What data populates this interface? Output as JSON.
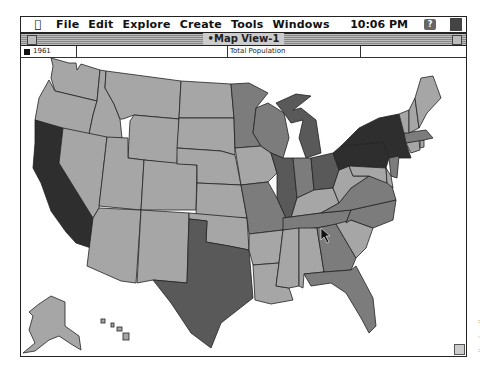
{
  "menubar": {
    "apple_icon": "",
    "items": [
      "File",
      "Edit",
      "Explore",
      "Create",
      "Tools",
      "Windows"
    ],
    "clock": "10:06 PM",
    "help_icon": "?"
  },
  "window": {
    "title": "•Map View-1",
    "info": {
      "year": "1961",
      "variable": "Total Population",
      "empty_cell": ""
    }
  },
  "legend_colors": {
    "light": "#a6a6a6",
    "medium": "#7c7c7c",
    "dark": "#595959",
    "darkest": "#2e2e2e"
  },
  "map": {
    "title": "Total Population",
    "year": "1961",
    "states": [
      {
        "id": "WA",
        "class": "light"
      },
      {
        "id": "OR",
        "class": "light"
      },
      {
        "id": "CA",
        "class": "darkest"
      },
      {
        "id": "ID",
        "class": "light"
      },
      {
        "id": "NV",
        "class": "light"
      },
      {
        "id": "MT",
        "class": "light"
      },
      {
        "id": "WY",
        "class": "light"
      },
      {
        "id": "UT",
        "class": "light"
      },
      {
        "id": "AZ",
        "class": "light"
      },
      {
        "id": "CO",
        "class": "light"
      },
      {
        "id": "NM",
        "class": "light"
      },
      {
        "id": "ND",
        "class": "light"
      },
      {
        "id": "SD",
        "class": "light"
      },
      {
        "id": "NE",
        "class": "light"
      },
      {
        "id": "KS",
        "class": "light"
      },
      {
        "id": "OK",
        "class": "light"
      },
      {
        "id": "TX",
        "class": "dark"
      },
      {
        "id": "MN",
        "class": "medium"
      },
      {
        "id": "IA",
        "class": "light"
      },
      {
        "id": "MO",
        "class": "medium"
      },
      {
        "id": "AR",
        "class": "light"
      },
      {
        "id": "LA",
        "class": "light"
      },
      {
        "id": "WI",
        "class": "medium"
      },
      {
        "id": "IL",
        "class": "dark"
      },
      {
        "id": "MI",
        "class": "dark"
      },
      {
        "id": "IN",
        "class": "medium"
      },
      {
        "id": "OH",
        "class": "dark"
      },
      {
        "id": "KY",
        "class": "light"
      },
      {
        "id": "TN",
        "class": "medium"
      },
      {
        "id": "MS",
        "class": "light"
      },
      {
        "id": "AL",
        "class": "light"
      },
      {
        "id": "GA",
        "class": "medium"
      },
      {
        "id": "FL",
        "class": "medium"
      },
      {
        "id": "SC",
        "class": "light"
      },
      {
        "id": "NC",
        "class": "medium"
      },
      {
        "id": "VA",
        "class": "medium"
      },
      {
        "id": "WV",
        "class": "light"
      },
      {
        "id": "PA",
        "class": "darkest"
      },
      {
        "id": "NY",
        "class": "darkest"
      },
      {
        "id": "NJ",
        "class": "medium"
      },
      {
        "id": "MD",
        "class": "light"
      },
      {
        "id": "DE",
        "class": "light"
      },
      {
        "id": "CT",
        "class": "light"
      },
      {
        "id": "RI",
        "class": "light"
      },
      {
        "id": "MA",
        "class": "medium"
      },
      {
        "id": "VT",
        "class": "light"
      },
      {
        "id": "NH",
        "class": "light"
      },
      {
        "id": "ME",
        "class": "light"
      },
      {
        "id": "AK",
        "class": "light"
      },
      {
        "id": "HI",
        "class": "light"
      }
    ]
  }
}
